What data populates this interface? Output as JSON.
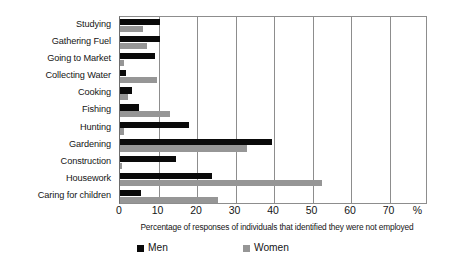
{
  "chart_data": {
    "type": "bar",
    "orientation": "horizontal",
    "title": "",
    "xlabel": "Percentage of responses of individuals that identified they were not employed",
    "ylabel": "",
    "xlim": [
      0,
      80
    ],
    "xticks": [
      0,
      10,
      20,
      30,
      40,
      50,
      60,
      70
    ],
    "xtick_labels": [
      "0",
      "10",
      "20",
      "30",
      "40",
      "50",
      "60",
      "70"
    ],
    "x_unit_label": "%",
    "grid": true,
    "legend_position": "bottom",
    "categories": [
      "Studying",
      "Gathering Fuel",
      "Going to Market",
      "Collecting Water",
      "Cooking",
      "Fishing",
      "Hunting",
      "Gardening",
      "Construction",
      "Housework",
      "Caring for children"
    ],
    "series": [
      {
        "name": "Men",
        "color": "#0a0a0a",
        "values": [
          10.5,
          10.5,
          9,
          1.5,
          3,
          5,
          18,
          39.5,
          14.5,
          24,
          5.5
        ]
      },
      {
        "name": "Women",
        "color": "#969696",
        "values": [
          6,
          7,
          1,
          9.5,
          2,
          13,
          1,
          33,
          0.5,
          52.5,
          25.5
        ]
      }
    ]
  },
  "legend": {
    "items": [
      {
        "label": "Men",
        "color": "#0a0a0a"
      },
      {
        "label": "Women",
        "color": "#969696"
      }
    ]
  }
}
